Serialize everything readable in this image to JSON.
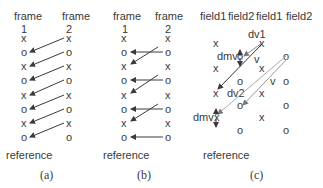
{
  "panels": [
    {
      "id": "a",
      "caption": "(a)",
      "columns": [
        {
          "title": "frame",
          "number": "1"
        },
        {
          "title": "frame",
          "number": "2"
        }
      ],
      "left_symbols": [
        "x",
        "o",
        "x",
        "o",
        "x",
        "o",
        "x",
        "o"
      ],
      "right_symbols": [
        "x",
        "o",
        "x",
        "o",
        "x",
        "o",
        "x",
        "o"
      ],
      "bottom_label": "reference",
      "arrows": [
        [
          0,
          1
        ],
        [
          1,
          2
        ],
        [
          2,
          3
        ],
        [
          3,
          4
        ],
        [
          4,
          5
        ],
        [
          5,
          6
        ],
        [
          6,
          7
        ]
      ]
    },
    {
      "id": "b",
      "caption": "(b)",
      "columns": [
        {
          "title": "frame",
          "number": "1"
        },
        {
          "title": "frame",
          "number": "2"
        }
      ],
      "left_symbols": [
        "x",
        "o",
        "x",
        "o",
        "x",
        "o",
        "x",
        "o"
      ],
      "right_symbols": [
        "x",
        "o",
        "x",
        "o",
        "x",
        "o",
        "x",
        "o"
      ],
      "bottom_label": "reference",
      "arrows_horizontal": [
        1,
        3,
        5,
        7
      ],
      "arrows_diagonal": [
        [
          0,
          2
        ],
        [
          2,
          4
        ],
        [
          4,
          6
        ]
      ]
    },
    {
      "id": "c",
      "caption": "(c)",
      "headers": [
        "field1",
        "field2",
        "field1",
        "field2"
      ],
      "bottom_label": "reference",
      "labels": {
        "dv1": "dv1",
        "dv2": "dv2",
        "dmv_top": "dmv",
        "dmv_bottom": "dmv",
        "v1": "v",
        "v2": "v"
      }
    }
  ]
}
